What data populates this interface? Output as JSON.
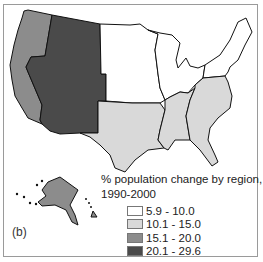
{
  "panel_label": "(b)",
  "legend": {
    "title_line1": "% population change by region,",
    "title_line2": "1990-2000",
    "items": [
      {
        "label": "5.9 - 10.0",
        "color": "#ffffff"
      },
      {
        "label": "10.1 - 15.0",
        "color": "#d9d9d9"
      },
      {
        "label": "15.1 - 20.0",
        "color": "#8c8c8c"
      },
      {
        "label": "20.1 - 29.6",
        "color": "#4a4a4a"
      }
    ]
  },
  "regions": [
    {
      "name": "Pacific",
      "states": [
        "WA",
        "OR",
        "CA",
        "AK",
        "HI"
      ],
      "class": "15.1 - 20.0"
    },
    {
      "name": "Mountain",
      "states": [
        "MT",
        "ID",
        "WY",
        "NV",
        "UT",
        "CO",
        "AZ",
        "NM"
      ],
      "class": "20.1 - 29.6"
    },
    {
      "name": "West North Central",
      "class": "5.9 - 10.0"
    },
    {
      "name": "East North Central",
      "class": "5.9 - 10.0"
    },
    {
      "name": "Middle Atlantic",
      "class": "5.9 - 10.0"
    },
    {
      "name": "New England",
      "class": "5.9 - 10.0"
    },
    {
      "name": "West South Central",
      "class": "10.1 - 15.0"
    },
    {
      "name": "East South Central",
      "class": "10.1 - 15.0"
    },
    {
      "name": "South Atlantic",
      "class": "10.1 - 15.0"
    }
  ]
}
